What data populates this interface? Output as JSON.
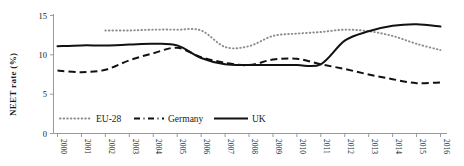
{
  "chart_data": {
    "type": "line",
    "title": "",
    "xlabel": "",
    "ylabel": "NEET rate (%)",
    "grid": false,
    "legend_position": "bottom-left",
    "xlim": [
      2000,
      2016
    ],
    "ylim": [
      0,
      15
    ],
    "yticks": [
      0,
      5,
      10,
      15
    ],
    "categories": [
      "2000",
      "2001",
      "2002",
      "2003",
      "2004",
      "2005",
      "2006",
      "2007",
      "2008",
      "2009",
      "2010",
      "2011",
      "2012",
      "2013",
      "2014",
      "2015",
      "2016"
    ],
    "x": [
      2000,
      2001,
      2002,
      2003,
      2004,
      2005,
      2006,
      2007,
      2008,
      2009,
      2010,
      2011,
      2012,
      2013,
      2014,
      2015,
      2016
    ],
    "series": [
      {
        "name": "EU-28",
        "style": "dotted",
        "color": "#8c8c8c",
        "values": [
          null,
          null,
          13.1,
          13.1,
          13.2,
          13.2,
          13.1,
          11.0,
          11.1,
          12.4,
          12.7,
          12.9,
          13.2,
          13.0,
          12.4,
          11.4,
          10.6
        ]
      },
      {
        "name": "Germany",
        "style": "dashed",
        "color": "#111111",
        "values": [
          8.0,
          7.8,
          8.1,
          9.3,
          10.2,
          10.9,
          9.7,
          9.0,
          8.7,
          9.4,
          9.5,
          8.8,
          8.2,
          7.5,
          6.9,
          6.4,
          6.5
        ]
      },
      {
        "name": "UK",
        "style": "solid",
        "color": "#111111",
        "values": [
          11.1,
          11.2,
          11.2,
          11.3,
          11.4,
          11.2,
          9.6,
          8.8,
          8.7,
          8.7,
          8.7,
          8.8,
          9.3,
          11.8,
          12.0,
          12.4,
          13.1
        ]
      }
    ],
    "series_uk_actual": [
      11.1,
      11.2,
      11.2,
      11.3,
      11.4,
      11.2,
      9.6,
      8.8,
      8.7,
      8.7,
      8.7,
      8.8,
      11.8,
      13.0,
      13.7,
      13.9,
      13.6
    ]
  },
  "legend": {
    "items": [
      {
        "label": "EU-28",
        "style": "dotted"
      },
      {
        "label": "Germany",
        "style": "dash-dot"
      },
      {
        "label": "UK",
        "style": "solid"
      }
    ]
  },
  "axes": {
    "y_title": "NEET rate (%)",
    "y_ticks": [
      "0",
      "5",
      "10",
      "15"
    ],
    "x_ticks": [
      "2000",
      "2001",
      "2002",
      "2003",
      "2004",
      "2005",
      "2006",
      "2007",
      "2008",
      "2009",
      "2010",
      "2011",
      "2012",
      "2013",
      "2014",
      "2015",
      "2016"
    ]
  },
  "colors": {
    "axis": "#9a9a9a",
    "eu28": "#8c8c8c",
    "germany": "#111111",
    "uk": "#111111",
    "text": "#1a1a1a",
    "background": "#ffffff"
  }
}
